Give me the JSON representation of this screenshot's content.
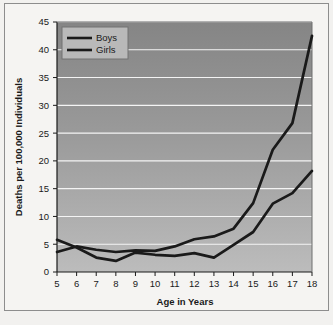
{
  "chart_data": {
    "type": "line",
    "title": "",
    "xlabel": "Age in Years",
    "ylabel": "Deaths per 100,000 Individuals",
    "x": [
      5,
      6,
      7,
      8,
      9,
      10,
      11,
      12,
      13,
      14,
      15,
      16,
      17,
      18
    ],
    "xticklabels": [
      "5",
      "6",
      "7",
      "8",
      "9",
      "10",
      "11",
      "12",
      "13",
      "14",
      "15",
      "16",
      "17",
      "18"
    ],
    "yticklabels": [
      "0",
      "5",
      "10",
      "15",
      "20",
      "25",
      "30",
      "35",
      "40",
      "45"
    ],
    "yticks": [
      0,
      5,
      10,
      15,
      20,
      25,
      30,
      35,
      40,
      45
    ],
    "ylim": [
      0,
      45
    ],
    "xlim": [
      5,
      18
    ],
    "grid": "horizontal",
    "legend_position": "top-left",
    "series": [
      {
        "name": "Boys",
        "color": "#1a1a1a",
        "values": [
          3.6,
          4.6,
          4.0,
          3.6,
          3.9,
          3.8,
          4.6,
          5.9,
          6.4,
          7.8,
          12.4,
          22.0,
          26.8,
          42.5
        ]
      },
      {
        "name": "Girls",
        "color": "#1a1a1a",
        "values": [
          5.8,
          4.4,
          2.6,
          2.0,
          3.5,
          3.1,
          2.9,
          3.4,
          2.6,
          4.9,
          7.2,
          12.3,
          14.2,
          18.2
        ]
      }
    ]
  },
  "legend": {
    "items": [
      {
        "label": "Boys"
      },
      {
        "label": "Girls"
      }
    ]
  },
  "axes": {
    "x_title": "Age in Years",
    "y_title": "Deaths per 100,000 Individuals"
  },
  "colors": {
    "plot_bg_top": "#8b8b8b",
    "plot_bg_bottom": "#b6b6b6",
    "gridline": "#f4f4f4",
    "line": "#1a1a1a",
    "legend_bg": "#b9b9b9",
    "figure_bg": "#f5f4f2",
    "border": "#8d8d8d"
  }
}
